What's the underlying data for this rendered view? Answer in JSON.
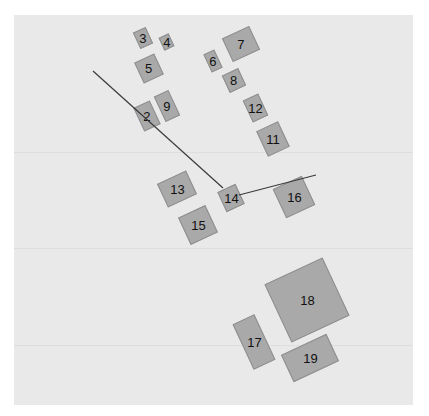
{
  "diagram": {
    "background": "#e9e9e9",
    "lot_fill": "#a9a9a9",
    "lot_border": "#8f8f8f",
    "line_color": "#3a3a3a",
    "lots": [
      {
        "id": "2",
        "label": "2",
        "cx": 147,
        "cy": 116,
        "w": 18,
        "h": 26,
        "rot": -25
      },
      {
        "id": "3",
        "label": "3",
        "cx": 143,
        "cy": 38,
        "w": 14,
        "h": 18,
        "rot": -25
      },
      {
        "id": "4",
        "label": "4",
        "cx": 166,
        "cy": 42,
        "w": 11,
        "h": 14,
        "rot": -25
      },
      {
        "id": "5",
        "label": "5",
        "cx": 149,
        "cy": 68,
        "w": 22,
        "h": 23,
        "rot": -25
      },
      {
        "id": "6",
        "label": "6",
        "cx": 213,
        "cy": 61,
        "w": 12,
        "h": 20,
        "rot": -25
      },
      {
        "id": "7",
        "label": "7",
        "cx": 241,
        "cy": 44,
        "w": 30,
        "h": 26,
        "rot": -25
      },
      {
        "id": "8",
        "label": "8",
        "cx": 234,
        "cy": 80,
        "w": 18,
        "h": 19,
        "rot": -25
      },
      {
        "id": "9",
        "label": "9",
        "cx": 167,
        "cy": 106,
        "w": 16,
        "h": 28,
        "rot": -25
      },
      {
        "id": "11",
        "label": "11",
        "cx": 273,
        "cy": 139,
        "w": 24,
        "h": 28,
        "rot": -25
      },
      {
        "id": "12",
        "label": "12",
        "cx": 255,
        "cy": 108,
        "w": 17,
        "h": 24,
        "rot": -25
      },
      {
        "id": "13",
        "label": "13",
        "cx": 177,
        "cy": 189,
        "w": 32,
        "h": 26,
        "rot": -25
      },
      {
        "id": "14",
        "label": "14",
        "cx": 231,
        "cy": 198,
        "w": 20,
        "h": 22,
        "rot": -25
      },
      {
        "id": "15",
        "label": "15",
        "cx": 198,
        "cy": 225,
        "w": 30,
        "h": 30,
        "rot": -25
      },
      {
        "id": "16",
        "label": "16",
        "cx": 294,
        "cy": 197,
        "w": 32,
        "h": 32,
        "rot": -25
      },
      {
        "id": "17",
        "label": "17",
        "cx": 254,
        "cy": 342,
        "w": 24,
        "h": 50,
        "rot": -25
      },
      {
        "id": "18",
        "label": "18",
        "cx": 307,
        "cy": 300,
        "w": 64,
        "h": 64,
        "rot": -25
      },
      {
        "id": "19",
        "label": "19",
        "cx": 310,
        "cy": 358,
        "w": 50,
        "h": 30,
        "rot": -25
      }
    ],
    "lines": [
      {
        "id": "path-a",
        "x1": 93,
        "y1": 71,
        "x2": 223,
        "y2": 188
      },
      {
        "id": "path-b",
        "x1": 239,
        "y1": 195,
        "x2": 316,
        "y2": 175
      }
    ],
    "gridlines_y": [
      152,
      248,
      345
    ]
  }
}
